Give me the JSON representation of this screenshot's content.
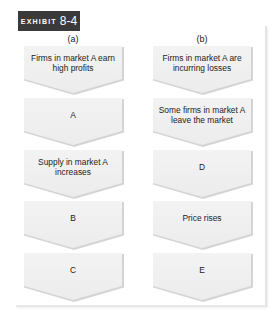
{
  "exhibit": {
    "keyword": "EXHIBIT",
    "number": "8-4"
  },
  "columns": [
    {
      "label": "(a)",
      "steps": [
        "Firms in market A earn high profits",
        "A",
        "Supply in market A increases",
        "B",
        "C"
      ]
    },
    {
      "label": "(b)",
      "steps": [
        "Firms in market A are incurring losses",
        "Some firms in market A leave the market",
        "D",
        "Price rises",
        "E"
      ]
    }
  ],
  "colors": {
    "badge_bg": "#3a3a3a",
    "box_fill": "#efefef",
    "box_edge": "#d4d4d4",
    "text": "#222222"
  }
}
